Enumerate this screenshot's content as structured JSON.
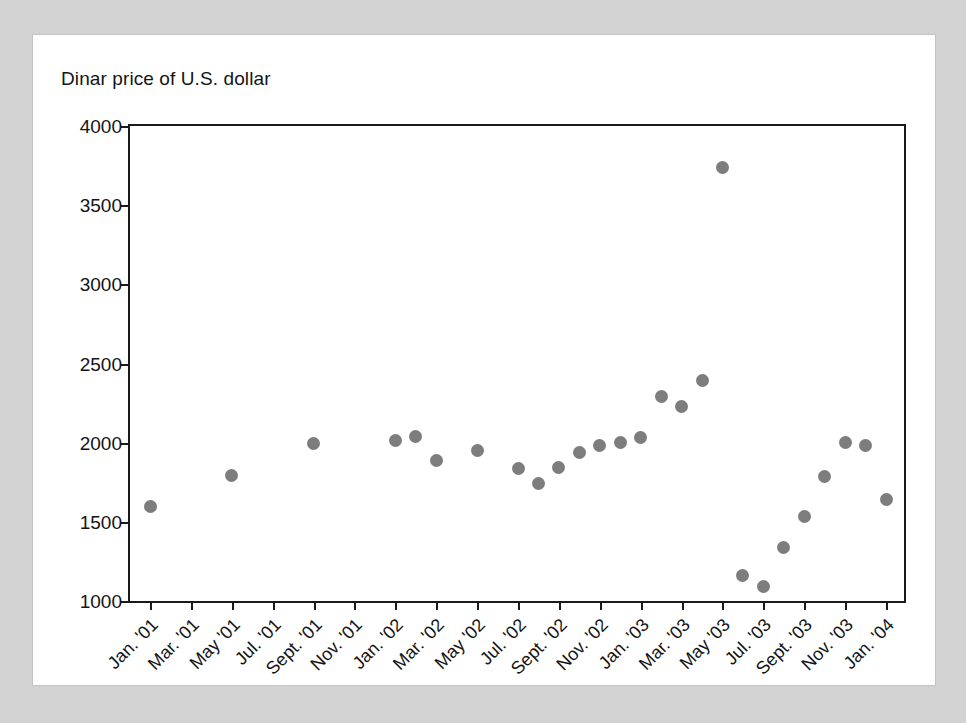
{
  "chart_data": {
    "type": "scatter",
    "title": "Dinar price of U.S. dollar",
    "xlabel": "",
    "ylabel": "",
    "ylim": [
      1000,
      4000
    ],
    "y_ticks": [
      1000,
      1500,
      2000,
      2500,
      3000,
      3500,
      4000
    ],
    "y_tick_labels": [
      "1000",
      "1500",
      "2000",
      "2500",
      "3000",
      "3500",
      "4000"
    ],
    "grid": false,
    "legend": null,
    "x_tick_labels": [
      "Jan. '01",
      "Mar. '01",
      "May '01",
      "Jul. '01",
      "Sept. '01",
      "Nov. '01",
      "Jan. '02",
      "Mar. '02",
      "May '02",
      "Jul. '02",
      "Sept. '02",
      "Nov. '02",
      "Jan. '03",
      "Mar. '03",
      "May '03",
      "Jul. '03",
      "Sept. '03",
      "Nov. '03",
      "Jan. '04"
    ],
    "x_range": [
      "Jan. '01",
      "Jan. '04"
    ],
    "x_tick_interval_months": 2,
    "point_color": "#7d7d7d",
    "axis_color": "#1a1a1a",
    "points": [
      {
        "x": "Jan. '01",
        "month_index": 0,
        "y": 1600
      },
      {
        "x": "May '01",
        "month_index": 4,
        "y": 1795
      },
      {
        "x": "Sept. '01",
        "month_index": 8,
        "y": 1995
      },
      {
        "x": "Jan. '02",
        "month_index": 12,
        "y": 2015
      },
      {
        "x": "Feb. '02",
        "month_index": 13,
        "y": 2040
      },
      {
        "x": "Mar. '02",
        "month_index": 14,
        "y": 1890
      },
      {
        "x": "May '02",
        "month_index": 16,
        "y": 1950
      },
      {
        "x": "Jul. '02",
        "month_index": 18,
        "y": 1840
      },
      {
        "x": "Aug. '02",
        "month_index": 19,
        "y": 1745
      },
      {
        "x": "Sept. '02",
        "month_index": 20,
        "y": 1845
      },
      {
        "x": "Oct. '02",
        "month_index": 21,
        "y": 1940
      },
      {
        "x": "Nov. '02",
        "month_index": 22,
        "y": 1985
      },
      {
        "x": "Dec. '02",
        "month_index": 23,
        "y": 2000
      },
      {
        "x": "Jan. '03",
        "month_index": 24,
        "y": 2030
      },
      {
        "x": "Feb. '03",
        "month_index": 25,
        "y": 2290
      },
      {
        "x": "Mar. '03",
        "month_index": 26,
        "y": 2230
      },
      {
        "x": "Apr. '03",
        "month_index": 27,
        "y": 2390
      },
      {
        "x": "May '03",
        "month_index": 28,
        "y": 3740
      },
      {
        "x": "Jun. '03",
        "month_index": 29,
        "y": 1160
      },
      {
        "x": "Jul. '03",
        "month_index": 30,
        "y": 1090
      },
      {
        "x": "Aug. '03",
        "month_index": 31,
        "y": 1340
      },
      {
        "x": "Sept. '03",
        "month_index": 32,
        "y": 1535
      },
      {
        "x": "Oct. '03",
        "month_index": 33,
        "y": 1785
      },
      {
        "x": "Nov. '03",
        "month_index": 34,
        "y": 2000
      },
      {
        "x": "Dec. '03",
        "month_index": 35,
        "y": 1980
      },
      {
        "x": "Jan. '04",
        "month_index": 36,
        "y": 1640
      }
    ]
  }
}
